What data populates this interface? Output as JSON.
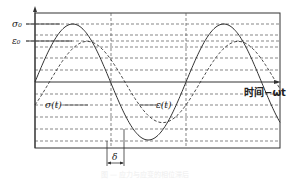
{
  "diagram": {
    "labels": {
      "sigma0": "σ₀",
      "epsilon0": "ε₀",
      "sigma_t": "σ(t)",
      "epsilon_t": "ε(t)",
      "delta": "δ",
      "x_axis": "时间−ωt"
    },
    "caption": "图 — 应力与应变的相位滞后",
    "colors": {
      "line": "#333333",
      "grid": "#555555",
      "background": "#ffffff"
    },
    "curves": [
      {
        "name": "stress σ(t)",
        "style": "solid",
        "amplitude": "σ0",
        "phase": 0
      },
      {
        "name": "strain ε(t)",
        "style": "dashed",
        "amplitude": "ε0",
        "phase_lag": "δ"
      }
    ]
  },
  "chart_data": {
    "type": "line",
    "title": "",
    "xlabel": "时间−ωt",
    "ylabel": "",
    "series": [
      {
        "name": "σ(t)",
        "amplitude": 1.0,
        "phase_lag_rad": 0,
        "style": "solid"
      },
      {
        "name": "ε(t)",
        "amplitude": 0.7,
        "phase_lag_rad": 0.6,
        "style": "dashed"
      }
    ],
    "annotations": [
      "σ0",
      "ε0",
      "δ"
    ],
    "grid": true
  }
}
